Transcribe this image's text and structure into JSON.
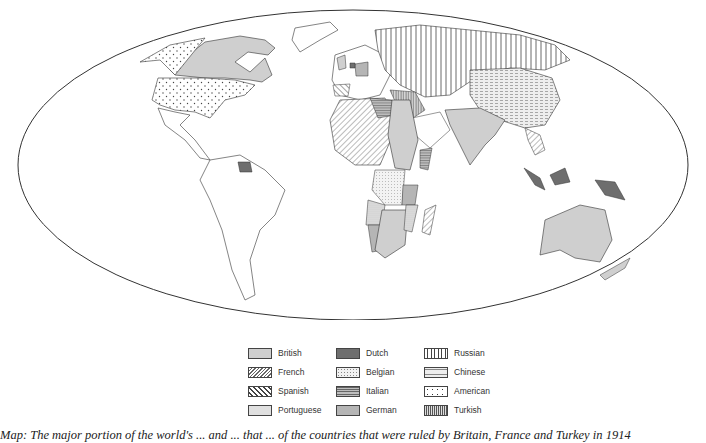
{
  "map": {
    "title": "World colonial empires map",
    "projection": "elliptical (Mollweide-like) world outline",
    "colors": {
      "background": "#ffffff",
      "outline": "#333333",
      "British": "#cfcfcf",
      "Dutch": "#6e6e6e",
      "Italian": "#9a9a9a",
      "German": "#b5b5b5"
    }
  },
  "legend": {
    "items": [
      {
        "label": "British",
        "pattern": "solid-light-gray"
      },
      {
        "label": "French",
        "pattern": "diagonal-hatch-right"
      },
      {
        "label": "Spanish",
        "pattern": "diagonal-hatch-left"
      },
      {
        "label": "Portuguese",
        "pattern": "fine-dots"
      },
      {
        "label": "Dutch",
        "pattern": "solid-dark-gray"
      },
      {
        "label": "Belgian",
        "pattern": "sparse-fine-dots"
      },
      {
        "label": "Italian",
        "pattern": "horizontal-lines"
      },
      {
        "label": "German",
        "pattern": "solid-medium-gray"
      },
      {
        "label": "Russian",
        "pattern": "vertical-lines"
      },
      {
        "label": "Chinese",
        "pattern": "dashed-horizontal"
      },
      {
        "label": "American",
        "pattern": "large-dots"
      },
      {
        "label": "Turkish",
        "pattern": "dense-vertical-lines"
      }
    ]
  },
  "caption": {
    "text": "Map: The major portion of the world's ... and ... that ... of the countries that were ruled by Britain, France and Turkey in 1914"
  }
}
